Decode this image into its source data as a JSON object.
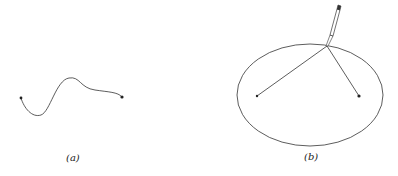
{
  "panels": [
    {
      "id": "a",
      "label": "(a)",
      "description": "String with two fixed endpoints (pins) in a loose curve"
    },
    {
      "id": "b",
      "label": "(b)",
      "description": "String taut around pencil tracing an ellipse around two foci"
    }
  ],
  "colors": {
    "stroke": "#333333",
    "background": "#ffffff"
  }
}
